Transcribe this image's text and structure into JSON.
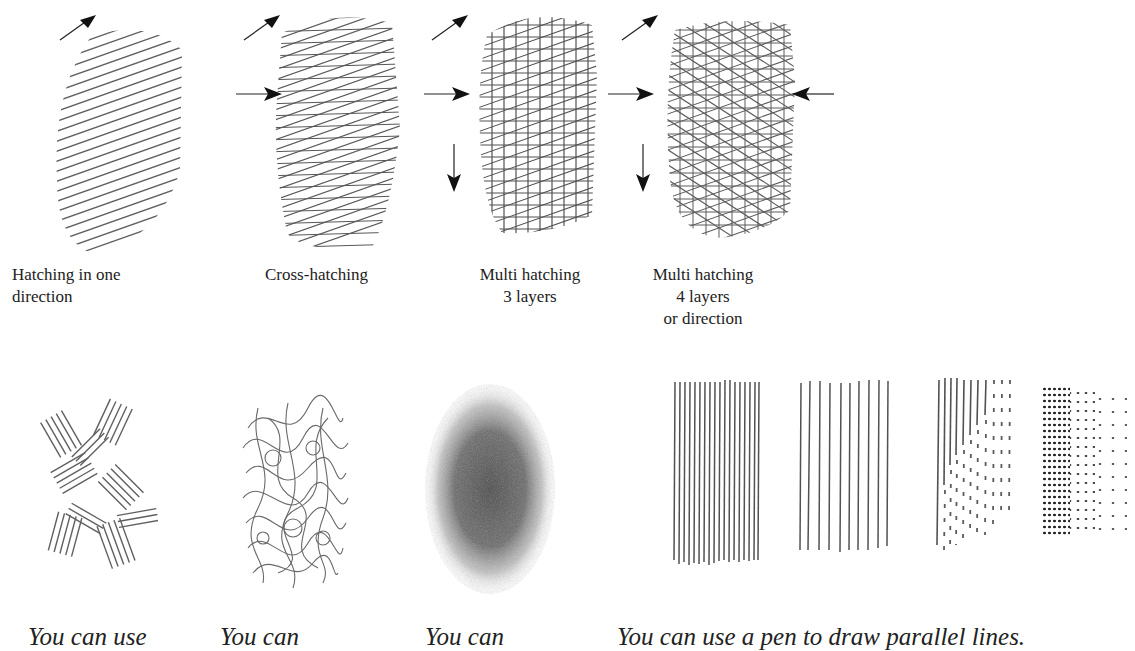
{
  "top_row": {
    "techniques": [
      {
        "id": "one-direction",
        "label_lines": [
          "Hatching in one",
          "direction"
        ],
        "arrows": [
          "diagonal-up-right"
        ]
      },
      {
        "id": "cross-hatching",
        "label_lines": [
          "Cross-hatching"
        ],
        "arrows": [
          "diagonal-up-right",
          "right"
        ]
      },
      {
        "id": "multi-3",
        "label_lines": [
          "Multi hatching",
          "3 layers"
        ],
        "arrows": [
          "diagonal-up-right",
          "right",
          "down"
        ]
      },
      {
        "id": "multi-4",
        "label_lines": [
          "Multi hatching",
          "4 layers",
          "or direction"
        ],
        "arrows": [
          "diagonal-up-right",
          "right",
          "down",
          "left"
        ]
      }
    ]
  },
  "bottom_row": {
    "captions": [
      {
        "id": "caption-1",
        "text": "You can use"
      },
      {
        "id": "caption-2",
        "text": "You can"
      },
      {
        "id": "caption-3",
        "text": "You can"
      },
      {
        "id": "caption-4",
        "text": "You can use a pen to draw parallel lines."
      }
    ],
    "swatches": [
      {
        "id": "scribble-blocks",
        "description": "short hatch blocks in varied directions"
      },
      {
        "id": "scribble-loops",
        "description": "loose looping scribbles"
      },
      {
        "id": "stipple-blend",
        "description": "soft smudged stipple oval"
      },
      {
        "id": "pen-lines-dense",
        "description": "dense parallel vertical pen lines"
      },
      {
        "id": "pen-lines-spaced",
        "description": "spaced parallel vertical pen lines"
      },
      {
        "id": "pen-lines-dashes",
        "description": "vertical lines breaking into dashes"
      },
      {
        "id": "pen-dots",
        "description": "dots fading left to right"
      }
    ]
  },
  "colors": {
    "ink": "#222222",
    "paper": "#ffffff",
    "graphite": "#555555"
  }
}
